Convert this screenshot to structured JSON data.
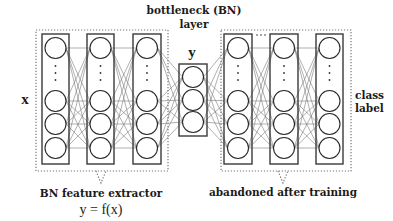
{
  "diagram": {
    "type": "neural-network-architecture",
    "labels": {
      "input": "x",
      "bottleneck_title_line1": "bottleneck (BN)",
      "bottleneck_title_line2": "layer",
      "bottleneck_output": "y",
      "output": "class",
      "output_line2": "label",
      "left_group": "BN feature extractor",
      "left_group_formula": "y = f(x)",
      "right_group": "abandoned after training"
    },
    "colors": {
      "stroke": "#3a3a3a",
      "edge": "#7a7a7a",
      "dotted_box": "#777777",
      "background": "#ffffff"
    },
    "groups": [
      {
        "id": "left",
        "name": "BN feature extractor",
        "columns": 3,
        "nodes_per_column_visible": 4,
        "has_ellipsis": true
      },
      {
        "id": "bottleneck",
        "name": "bottleneck (BN) layer",
        "columns": 1,
        "nodes_per_column_visible": 3,
        "has_ellipsis": false
      },
      {
        "id": "right",
        "name": "abandoned after training",
        "columns": 3,
        "nodes_per_column_visible": 4,
        "has_ellipsis": true,
        "horizontal_ellipsis_between_col1_col2": true
      }
    ]
  }
}
